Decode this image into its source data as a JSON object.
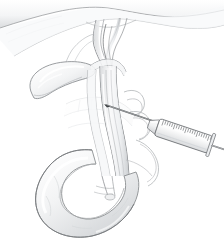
{
  "illustration": {
    "title": "Biliary Tract Needle Aspiration",
    "subject": "Common bile duct puncture with syringe and needle",
    "style": "grayscale pencil/line medical illustration",
    "background_color": "#ffffff",
    "canvas": {
      "width": 224,
      "height": 243
    },
    "line_color": "#6d7073",
    "fill_light": "#fbfbfc",
    "fill_mid": "#e9eaec",
    "fill_shadow": "#c9cbcd",
    "accent_dark": "#4a4d50"
  },
  "anatomy": {
    "liver": {
      "label": "Liver inferior edge",
      "position": "top band spanning full width",
      "shading": "very light gray gradient"
    },
    "gallbladder": {
      "label": "Gallbladder",
      "position": "upper left, pear-shaped",
      "orientation": "fundus lower-left, neck upper-right"
    },
    "cystic_duct": {
      "label": "Cystic duct",
      "position": "curving right from gallbladder neck to common duct"
    },
    "hepatic_ducts": {
      "label": "Right and left hepatic ducts",
      "position": "top center, converging bifurcation beneath liver"
    },
    "common_bile_duct": {
      "label": "Common bile duct",
      "position": "descending center, entering duodenum"
    },
    "pancreas": {
      "label": "Pancreas",
      "position": "mid-left faint outline behind ducts"
    },
    "duodenum": {
      "label": "Duodenum (C-loop)",
      "position": "bottom, C-shaped curve open to the right"
    },
    "vessels": {
      "label": "Portal vessels / arterial loops",
      "position": "right of center, behind syringe"
    },
    "ampulla": {
      "label": "Ampulla of Vater",
      "position": "inner duodenal curve, lower center"
    }
  },
  "instrument": {
    "name": "Syringe with hypodermic needle",
    "needle": {
      "label": "Needle",
      "entry_point": "common bile duct",
      "angle_degrees": -27,
      "tip_position": "upper left of barrel"
    },
    "hub": {
      "label": "Needle hub / luer lock"
    },
    "barrel": {
      "label": "Syringe barrel",
      "graduation_marks": 22,
      "graduation_label": "volume graduations"
    },
    "plunger": {
      "label": "Plunger rod",
      "position": "extending toward lower right, off-frame"
    }
  }
}
